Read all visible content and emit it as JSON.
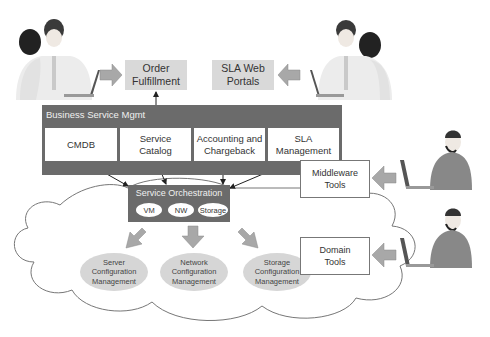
{
  "diagram": {
    "top_boxes": {
      "order_fulfillment": "Order\nFulfillment",
      "sla_web_portals": "SLA Web\nPortals"
    },
    "business_service_mgmt": {
      "title": "Business Service Mgmt",
      "components": [
        {
          "label": "CMDB"
        },
        {
          "label": "Service\nCatalog"
        },
        {
          "label": "Accounting and\nChargeback"
        },
        {
          "label": "SLA\nManagement"
        }
      ]
    },
    "service_orchestration": {
      "title": "Service Orchestration",
      "items": [
        "VM",
        "NW",
        "Storage"
      ]
    },
    "configuration_management": [
      {
        "label": "Server\nConfiguration\nManagement"
      },
      {
        "label": "Network\nConfiguration\nManagement"
      },
      {
        "label": "Storage\nConfiguration\nManagement"
      }
    ],
    "tools": {
      "middleware": "Middleware\nTools",
      "domain": "Domain\nTools"
    },
    "colors": {
      "dark_box": "#6b6b6b",
      "light_box": "#d9d9d9",
      "ellipse": "#d6d6d6",
      "arrow_fill": "#a8a8a8"
    }
  }
}
